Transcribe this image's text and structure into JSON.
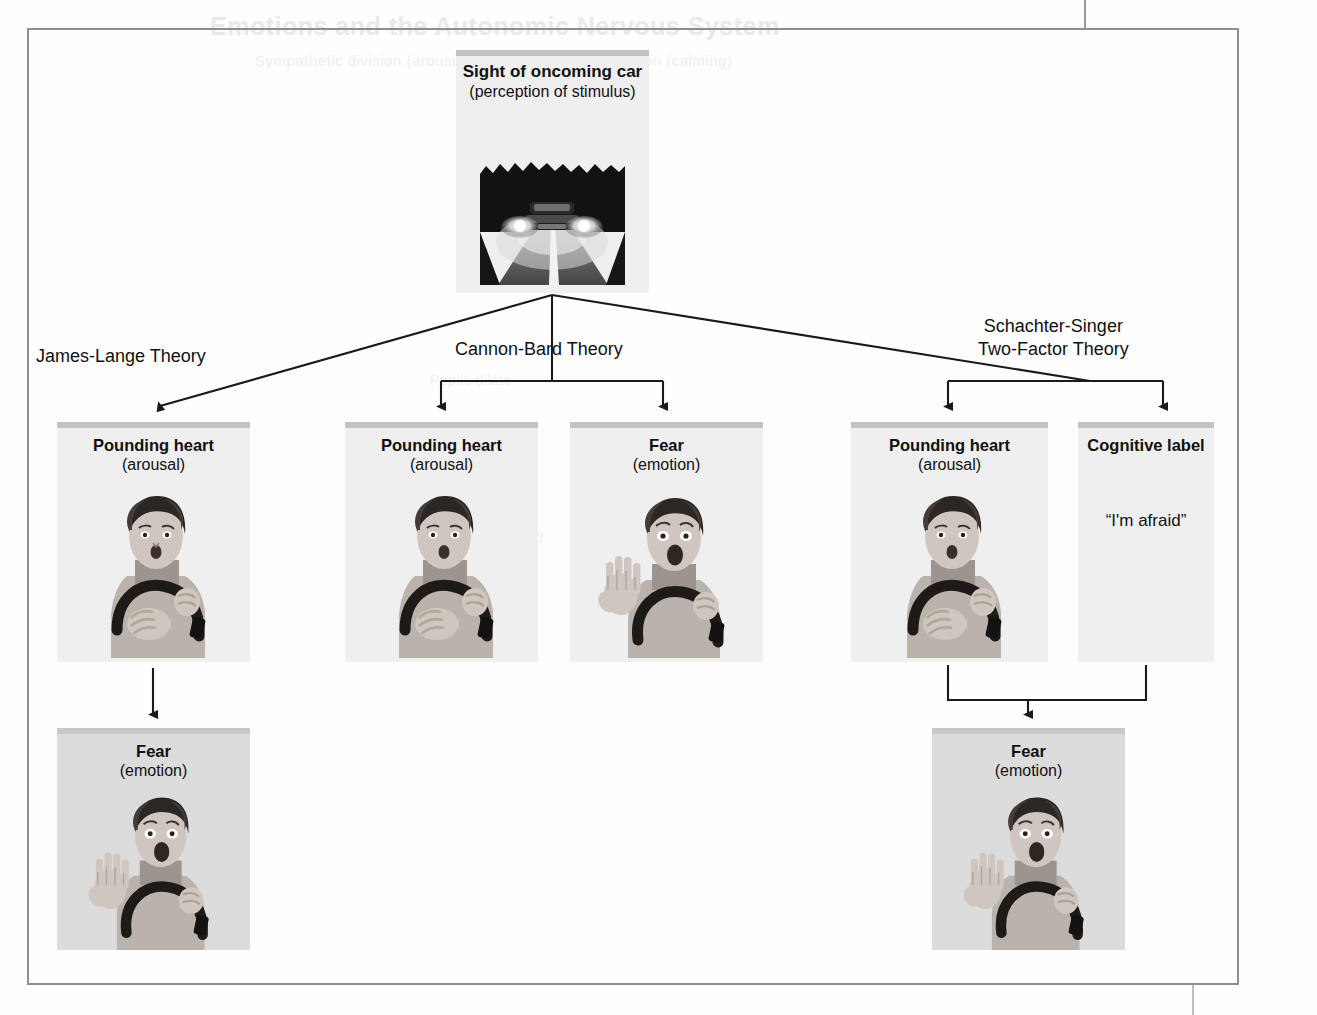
{
  "page": {
    "ghost_title": "Emotions and the Autonomic Nervous System",
    "ghost_subtitle": "Sympathetic division (arousing)                Parasympathetic division (calming)",
    "ghost_line_a": "Pupils dilate",
    "ghost_line_b": "Digestion inhibited"
  },
  "diagram": {
    "stimulus": {
      "headline": "Sight of oncoming car",
      "subline": "(perception of stimulus)",
      "art": "oncoming-car-night-road"
    },
    "theories": [
      {
        "id": "james-lange",
        "label_line1": "James-Lange Theory",
        "label_line2": ""
      },
      {
        "id": "cannon-bard",
        "label_line1": "Cannon-Bard Theory",
        "label_line2": ""
      },
      {
        "id": "schachter-singer",
        "label_line1": "Schachter-Singer",
        "label_line2": "Two-Factor Theory"
      }
    ],
    "nodes": [
      {
        "id": "jl-arousal",
        "headline": "Pounding heart",
        "subline": "(arousal)",
        "quote": "",
        "art": "woman-hand-on-chest"
      },
      {
        "id": "cb-arousal",
        "headline": "Pounding heart",
        "subline": "(arousal)",
        "quote": "",
        "art": "woman-hand-on-chest"
      },
      {
        "id": "cb-fear",
        "headline": "Fear",
        "subline": "(emotion)",
        "quote": "",
        "art": "woman-hand-raised-screaming"
      },
      {
        "id": "ss-arousal",
        "headline": "Pounding heart",
        "subline": "(arousal)",
        "quote": "",
        "art": "woman-hand-on-chest"
      },
      {
        "id": "ss-label",
        "headline": "Cognitive label",
        "subline": "",
        "quote": "“I'm afraid”",
        "art": ""
      },
      {
        "id": "jl-fear",
        "headline": "Fear",
        "subline": "(emotion)",
        "quote": "",
        "art": "woman-hand-raised-screaming"
      },
      {
        "id": "ss-fear",
        "headline": "Fear",
        "subline": "(emotion)",
        "quote": "",
        "art": "woman-hand-raised-screaming"
      }
    ],
    "colors": {
      "box_fill": "#ededed",
      "box_band": "#c2c2c2",
      "connector": "#1a1a1a",
      "frame": "#8e8e90",
      "text": "#111111"
    }
  }
}
